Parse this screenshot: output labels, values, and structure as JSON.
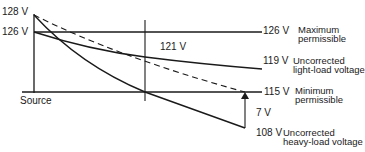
{
  "diagram": {
    "axis": {
      "left_labels": [
        "128 V",
        "126 V"
      ],
      "source_label": "Source"
    },
    "lines": {
      "max_permissible": {
        "value": "126 V",
        "label_line1": "Maximum",
        "label_line2": "permissible"
      },
      "light_load": {
        "mid_value": "121 V",
        "end_value": "119 V",
        "label_line1": "Uncorrected",
        "label_line2": "light-load voltage"
      },
      "min_permissible": {
        "value": "115 V",
        "label_line1": "Minimum",
        "label_line2": "permissible"
      },
      "heavy_load": {
        "end_value": "108 V",
        "label_line1": "Uncorrected",
        "label_line2": "heavy-load voltage"
      },
      "drop": {
        "value": "7 V"
      }
    },
    "colors": {
      "ink": "#1a1a1a",
      "background": "#ffffff"
    }
  }
}
